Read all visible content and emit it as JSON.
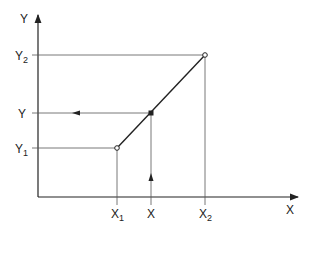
{
  "diagram": {
    "type": "linear-interpolation",
    "axes": {
      "x_label": "X",
      "y_label": "Y"
    },
    "x_ticks": [
      {
        "id": "x1",
        "base": "X",
        "sub": "1"
      },
      {
        "id": "x",
        "base": "X",
        "sub": ""
      },
      {
        "id": "x2",
        "base": "X",
        "sub": "2"
      }
    ],
    "y_ticks": [
      {
        "id": "y2",
        "base": "Y",
        "sub": "2"
      },
      {
        "id": "y",
        "base": "Y",
        "sub": ""
      },
      {
        "id": "y1",
        "base": "Y",
        "sub": "1"
      }
    ],
    "points": [
      {
        "name": "P1",
        "x": "X1",
        "y": "Y1",
        "marker": "open-circle"
      },
      {
        "name": "P",
        "x": "X",
        "y": "Y",
        "marker": "filled-square"
      },
      {
        "name": "P2",
        "x": "X2",
        "y": "Y2",
        "marker": "open-circle"
      }
    ],
    "colors": {
      "line": "#222222",
      "guide": "#555555",
      "background": "#ffffff"
    }
  }
}
